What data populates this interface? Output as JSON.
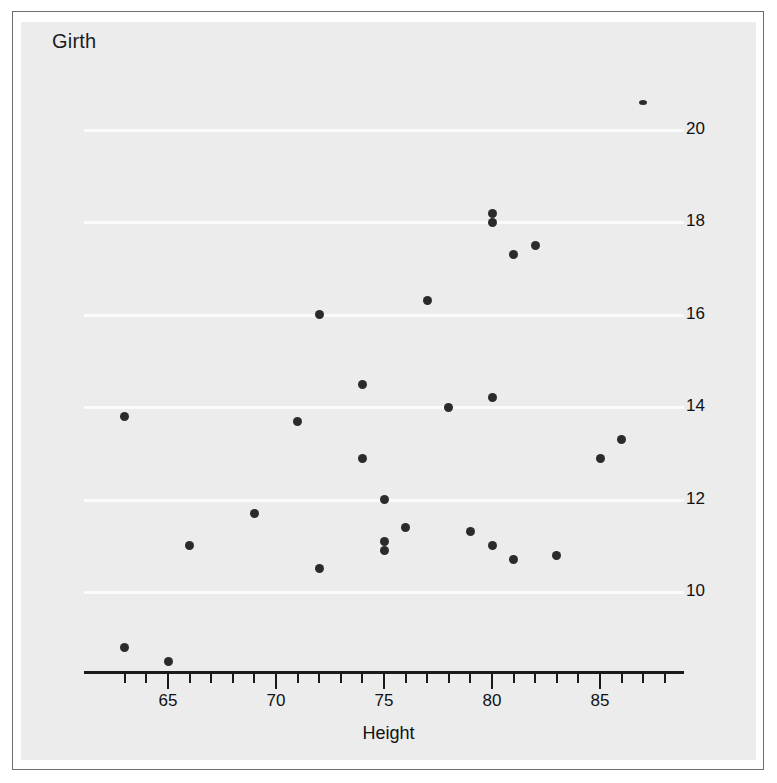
{
  "figure": {
    "title": "Girth",
    "background_color": "#ececed",
    "frame_color": "#6e6e6e",
    "point_color": "#2b2b2b",
    "gridline_color": "#fbfbfb"
  },
  "chart_data": {
    "type": "scatter",
    "title": "Girth",
    "xlabel": "Height",
    "ylabel": "Girth",
    "xlim": [
      62.5,
      88.5
    ],
    "ylim": [
      8.0,
      21.2
    ],
    "grid": true,
    "legend": null,
    "x_ticks_major": [
      65,
      70,
      75,
      80,
      85
    ],
    "x_tick_labels": [
      "65",
      "70",
      "75",
      "80",
      "85"
    ],
    "x_tick_minor_step": 1,
    "y_ticks": [
      10,
      12,
      14,
      16,
      18,
      20
    ],
    "y_tick_labels": [
      "10",
      "12",
      "14",
      "16",
      "18",
      "20"
    ],
    "y_axis_side": "right",
    "series": [
      {
        "name": "trees",
        "points": [
          {
            "x": 87,
            "y": 20.6,
            "marker": "tiny"
          },
          {
            "x": 80,
            "y": 18.0,
            "marker": "dot"
          },
          {
            "x": 80,
            "y": 18.2,
            "marker": "dot"
          },
          {
            "x": 82,
            "y": 17.5,
            "marker": "dot"
          },
          {
            "x": 81,
            "y": 17.3,
            "marker": "dot"
          },
          {
            "x": 77,
            "y": 16.3,
            "marker": "dot"
          },
          {
            "x": 72,
            "y": 16.0,
            "marker": "dot"
          },
          {
            "x": 74,
            "y": 14.5,
            "marker": "dot"
          },
          {
            "x": 80,
            "y": 14.2,
            "marker": "dot"
          },
          {
            "x": 78,
            "y": 14.0,
            "marker": "dot"
          },
          {
            "x": 63,
            "y": 13.8,
            "marker": "dot"
          },
          {
            "x": 71,
            "y": 13.7,
            "marker": "dot"
          },
          {
            "x": 86,
            "y": 13.3,
            "marker": "dot"
          },
          {
            "x": 85,
            "y": 12.9,
            "marker": "dot"
          },
          {
            "x": 74,
            "y": 12.9,
            "marker": "dot"
          },
          {
            "x": 75,
            "y": 12.0,
            "marker": "dot"
          },
          {
            "x": 69,
            "y": 11.7,
            "marker": "dot"
          },
          {
            "x": 76,
            "y": 11.4,
            "marker": "dot"
          },
          {
            "x": 79,
            "y": 11.3,
            "marker": "dot"
          },
          {
            "x": 75,
            "y": 11.1,
            "marker": "dot"
          },
          {
            "x": 80,
            "y": 11.0,
            "marker": "dot"
          },
          {
            "x": 75,
            "y": 10.9,
            "marker": "dot"
          },
          {
            "x": 66,
            "y": 11.0,
            "marker": "dot"
          },
          {
            "x": 83,
            "y": 10.8,
            "marker": "dot"
          },
          {
            "x": 81,
            "y": 10.7,
            "marker": "dot"
          },
          {
            "x": 72,
            "y": 10.5,
            "marker": "dot"
          },
          {
            "x": 63,
            "y": 8.8,
            "marker": "dot"
          },
          {
            "x": 65,
            "y": 8.5,
            "marker": "dot"
          }
        ]
      }
    ]
  }
}
